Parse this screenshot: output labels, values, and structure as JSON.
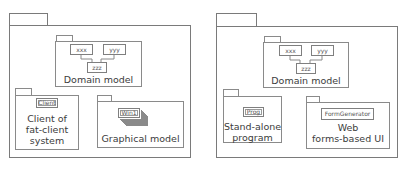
{
  "diagrams": [
    {
      "name": "fat-client-architecture",
      "domain_package": {
        "label": "Domain model",
        "classes": [
          "xxx",
          "yyy",
          "zzz"
        ]
      },
      "left_package": {
        "class": "Client",
        "label_lines": [
          "Client of",
          "fat-client",
          "system"
        ]
      },
      "right_package": {
        "class": "Win1",
        "label_lines": [
          "Graphical model"
        ]
      }
    },
    {
      "name": "standalone-web-architecture",
      "domain_package": {
        "label": "Domain model",
        "classes": [
          "xxx",
          "yyy",
          "zzz"
        ]
      },
      "left_package": {
        "class": "Prog",
        "label_lines": [
          "Stand-alone",
          "program"
        ]
      },
      "right_package": {
        "class": "FormGenerator",
        "label_lines": [
          "Web",
          "forms-based UI"
        ]
      }
    }
  ],
  "colors": {
    "line": "#8a8a8a",
    "text": "#3c3c3c",
    "background": "#ffffff"
  }
}
